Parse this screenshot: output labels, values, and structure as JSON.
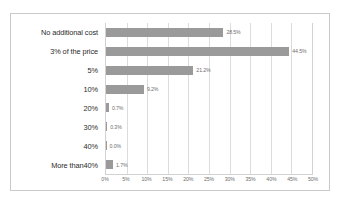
{
  "chart_data": {
    "type": "bar",
    "orientation": "horizontal",
    "title": "",
    "subtitle": "",
    "xlabel": "",
    "ylabel": "",
    "categories": [
      "No additional cost",
      "3% of the price",
      "5%",
      "10%",
      "20%",
      "30%",
      "40%",
      "More than40%"
    ],
    "values": [
      28.5,
      44.5,
      21.2,
      9.2,
      0.7,
      0.3,
      0.0,
      1.7
    ],
    "value_labels": [
      "28.5%",
      "44.5%",
      "21.2%",
      "9.2%",
      "0.7%",
      "0.3%",
      "0.0%",
      "1.7%"
    ],
    "xlim": [
      0,
      50
    ],
    "tick_labels": [
      "0%",
      "5%",
      "10%",
      "15%",
      "20%",
      "25%",
      "30%",
      "35%",
      "40%",
      "45%",
      "50%"
    ],
    "tick_values": [
      0,
      5,
      10,
      15,
      20,
      25,
      30,
      35,
      40,
      45,
      50
    ],
    "grid": true,
    "legend": false,
    "legend_position": "none",
    "bar_color": "#9a9a9a",
    "plot_background": "#ffffff",
    "gridline_color": "#dcdcdc",
    "frame_border_color": "#c9c9c9"
  }
}
